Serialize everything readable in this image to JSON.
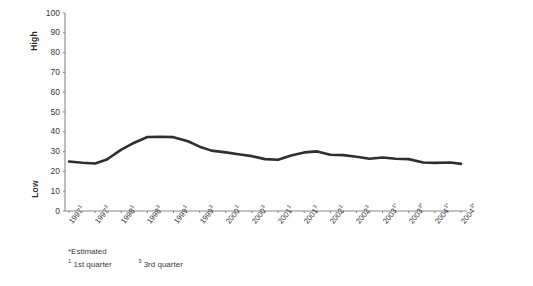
{
  "chart_data": {
    "type": "line",
    "title": "",
    "xlabel": "",
    "ylabel": "",
    "ylim": [
      0,
      100
    ],
    "ytick_values": [
      100,
      90,
      80,
      70,
      60,
      50,
      40,
      30,
      20,
      10,
      0
    ],
    "y_axis_top_label": "High",
    "y_axis_bottom_label": "Low",
    "grid": false,
    "legend": "none",
    "line_color": "#2f2f2f",
    "axis_color": "#8a8a8a",
    "categories": [
      "1997¹",
      "1997³",
      "1998¹",
      "1998³",
      "1999¹",
      "1999³",
      "2000¹",
      "2000³",
      "2001¹",
      "2001³",
      "2002¹",
      "2002³",
      "2003¹*",
      "2003³*",
      "2004¹*",
      "2004³*"
    ],
    "categories_parts": [
      {
        "year": "1997",
        "sup": "1"
      },
      {
        "year": "1997",
        "sup": "3"
      },
      {
        "year": "1998",
        "sup": "1"
      },
      {
        "year": "1998",
        "sup": "3"
      },
      {
        "year": "1999",
        "sup": "1"
      },
      {
        "year": "1999",
        "sup": "3"
      },
      {
        "year": "2000",
        "sup": "1"
      },
      {
        "year": "2000",
        "sup": "3"
      },
      {
        "year": "2001",
        "sup": "1"
      },
      {
        "year": "2001",
        "sup": "3"
      },
      {
        "year": "2002",
        "sup": "1"
      },
      {
        "year": "2002",
        "sup": "3"
      },
      {
        "year": "2003",
        "sup": "1*"
      },
      {
        "year": "2003",
        "sup": "3*"
      },
      {
        "year": "2004",
        "sup": "1*"
      },
      {
        "year": "2004",
        "sup": "3*"
      }
    ],
    "values": [
      25,
      24,
      31,
      37.5,
      36,
      30.5,
      28,
      26,
      29,
      30,
      28,
      26.5,
      26.5,
      25,
      24.5,
      24
    ],
    "series": [
      {
        "name": "index",
        "values": [
          25,
          24,
          31,
          37.5,
          36,
          30.5,
          28,
          26,
          29,
          30,
          28,
          26.5,
          26.5,
          25,
          24.5,
          24
        ]
      }
    ],
    "dense_points": [
      {
        "x": 0.0,
        "y": 25.0
      },
      {
        "x": 0.5,
        "y": 24.4
      },
      {
        "x": 1.0,
        "y": 24.0
      },
      {
        "x": 1.45,
        "y": 26.0
      },
      {
        "x": 2.0,
        "y": 31.0
      },
      {
        "x": 2.5,
        "y": 34.5
      },
      {
        "x": 3.0,
        "y": 37.4
      },
      {
        "x": 3.5,
        "y": 37.5
      },
      {
        "x": 4.0,
        "y": 37.3
      },
      {
        "x": 4.55,
        "y": 35.2
      },
      {
        "x": 5.0,
        "y": 32.5
      },
      {
        "x": 5.45,
        "y": 30.5
      },
      {
        "x": 6.0,
        "y": 29.6
      },
      {
        "x": 6.55,
        "y": 28.5
      },
      {
        "x": 7.0,
        "y": 27.7
      },
      {
        "x": 7.5,
        "y": 26.2
      },
      {
        "x": 8.0,
        "y": 25.9
      },
      {
        "x": 8.5,
        "y": 28.0
      },
      {
        "x": 9.0,
        "y": 29.6
      },
      {
        "x": 9.5,
        "y": 30.1
      },
      {
        "x": 10.0,
        "y": 28.4
      },
      {
        "x": 10.5,
        "y": 28.2
      },
      {
        "x": 11.0,
        "y": 27.4
      },
      {
        "x": 11.5,
        "y": 26.4
      },
      {
        "x": 12.0,
        "y": 27.0
      },
      {
        "x": 12.5,
        "y": 26.4
      },
      {
        "x": 13.0,
        "y": 26.2
      },
      {
        "x": 13.55,
        "y": 24.5
      },
      {
        "x": 14.0,
        "y": 24.3
      },
      {
        "x": 14.6,
        "y": 24.5
      },
      {
        "x": 15.0,
        "y": 23.8
      }
    ],
    "annotations": {
      "estimated_note": "*Estimated",
      "quarter_note_1_sup": "1",
      "quarter_note_1": "1st quarter",
      "quarter_note_3_sup": "3",
      "quarter_note_3": "3rd quarter"
    }
  }
}
